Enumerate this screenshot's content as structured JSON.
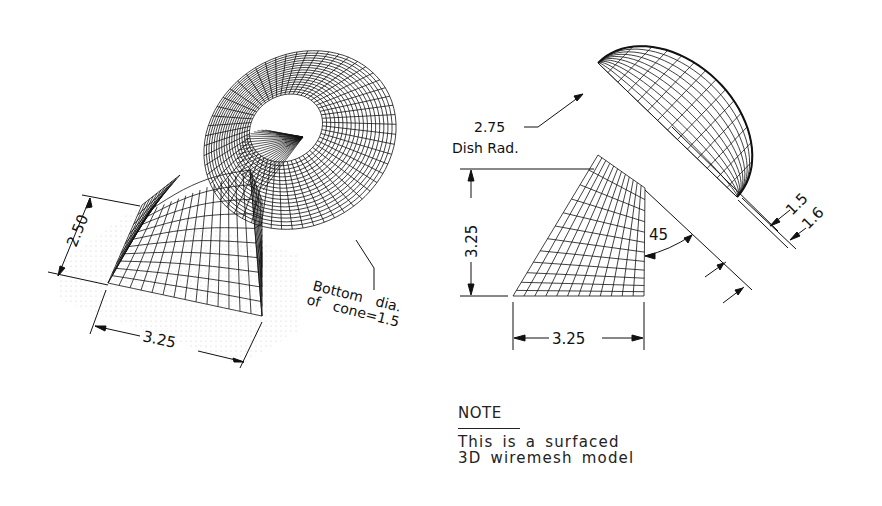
{
  "drawing": {
    "type": "CAD technical drawing",
    "left_view": {
      "label": "isometric view",
      "dims": {
        "height": "2.50",
        "width": "3.25",
        "cone_callout_line1": "Bottom   dia.",
        "cone_callout_line2": "of   cone=1.5"
      }
    },
    "right_view": {
      "label": "side view",
      "dims": {
        "dish_radius_value": "2.75",
        "dish_radius_label": "Dish Rad.",
        "height": "3.25",
        "width": "3.25",
        "angle": "45",
        "offset_a": "1.5",
        "offset_b": "1.6"
      }
    },
    "note": {
      "title": "NOTE",
      "line1": "This is a surfaced",
      "line2": "3D wiremesh model"
    }
  },
  "colors": {
    "ink": "#111111",
    "paper": "#ffffff",
    "hatch": "#cfcfcf"
  }
}
